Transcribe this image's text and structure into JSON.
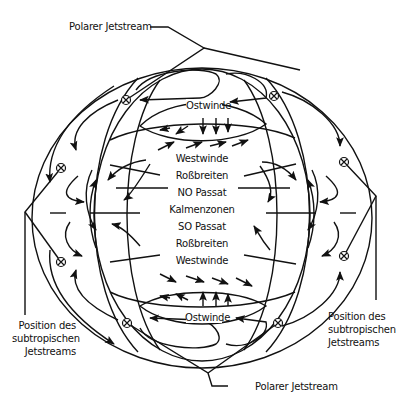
{
  "diagram": {
    "colors": {
      "stroke": "#111111",
      "background": "#ffffff"
    },
    "labels": {
      "polar_jet_top": "Polarer Jetstream",
      "polar_jet_bottom": "Polarer Jetstream",
      "subtropical_left": [
        "Position des",
        "subtropischen",
        "Jetstreams"
      ],
      "subtropical_right": [
        "Position des",
        "subtropischen",
        "Jetstreams"
      ],
      "ostwinde_top": "Ostwinde",
      "ostwinde_bottom": "Ostwinde"
    },
    "center_bands": [
      "Westwinde",
      "Roßbreiten",
      "NO Passat",
      "Kalmenzonen",
      "SO Passat",
      "Roßbreiten",
      "Westwinde"
    ],
    "jetstream_symbol": "⊗",
    "jetstream_positions": [
      {
        "x": 126,
        "y": 100
      },
      {
        "x": 274,
        "y": 96
      },
      {
        "x": 61,
        "y": 168
      },
      {
        "x": 344,
        "y": 162
      },
      {
        "x": 61,
        "y": 262
      },
      {
        "x": 344,
        "y": 256
      },
      {
        "x": 127,
        "y": 323
      },
      {
        "x": 278,
        "y": 323
      }
    ]
  }
}
